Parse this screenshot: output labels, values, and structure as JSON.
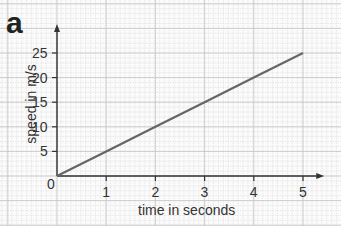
{
  "chart_data": {
    "type": "line",
    "panel_label": "a",
    "title": "",
    "xlabel": "time in seconds",
    "ylabel": "speed in m/s",
    "x_ticks": [
      0,
      1,
      2,
      3,
      4,
      5
    ],
    "y_ticks": [
      0,
      5,
      10,
      15,
      20,
      25
    ],
    "xlim": [
      0,
      5.4
    ],
    "ylim": [
      0,
      30
    ],
    "grid": true,
    "legend": null,
    "series": [
      {
        "name": "speed",
        "x": [
          0,
          1,
          2,
          3,
          4,
          5
        ],
        "y": [
          0,
          5,
          10,
          15,
          20,
          25
        ],
        "color": "#666666"
      }
    ]
  }
}
